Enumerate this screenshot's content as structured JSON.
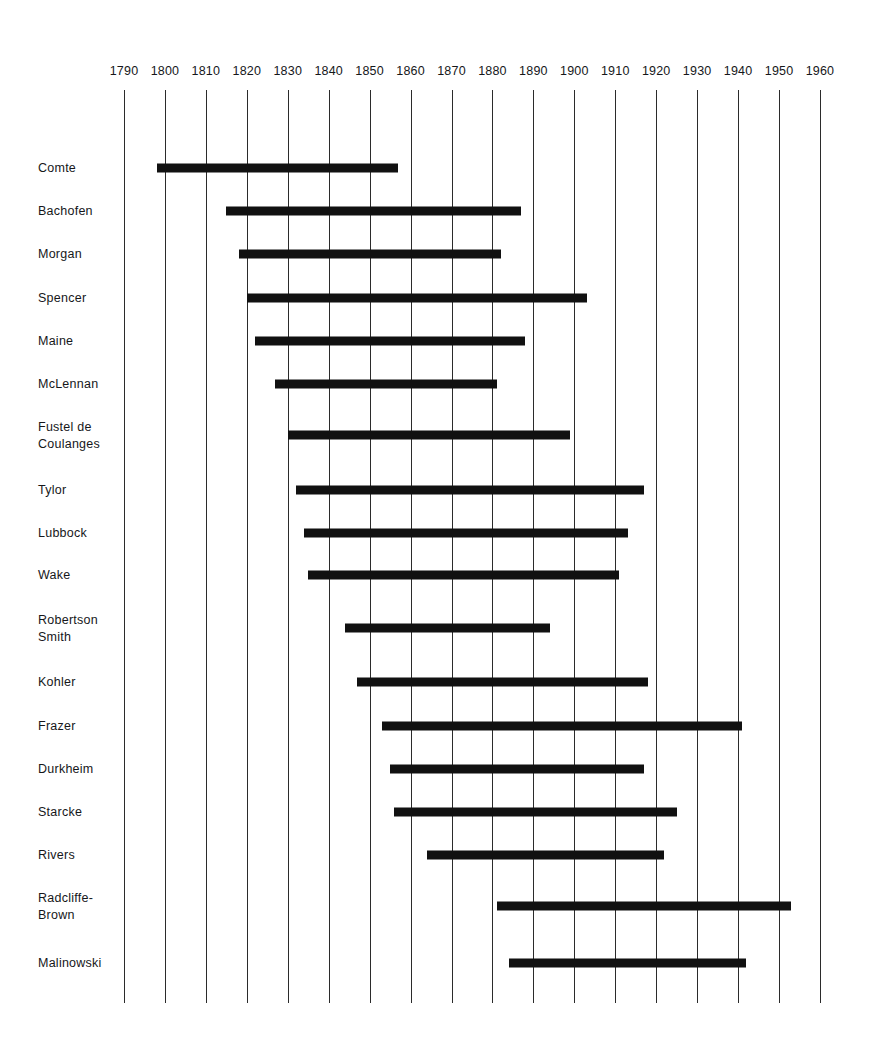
{
  "chart_data": {
    "type": "bar",
    "orientation": "horizontal-timeline",
    "title": "",
    "subtitle": "",
    "xlabel": "",
    "ylabel": "",
    "xlim": [
      1790,
      1960
    ],
    "x_tick_step": 10,
    "grid": true,
    "grid_axis": "x",
    "legend": null,
    "bar_color": "#111111",
    "grid_color": "#2b2b2b",
    "background_color": "#ffffff",
    "x_ticks": [
      "1790",
      "1800",
      "1810",
      "1820",
      "1830",
      "1840",
      "1850",
      "1860",
      "1870",
      "1880",
      "1890",
      "1900",
      "1910",
      "1920",
      "1930",
      "1940",
      "1950",
      "1960"
    ],
    "categories": [
      "Comte",
      "Bachofen",
      "Morgan",
      "Spencer",
      "Maine",
      "McLennan",
      "Fustel de Coulanges",
      "Tylor",
      "Lubbock",
      "Wake",
      "Robertson Smith",
      "Kohler",
      "Frazer",
      "Durkheim",
      "Starcke",
      "Rivers",
      "Radcliffe-Brown",
      "Malinowski"
    ],
    "spans": [
      {
        "name": "Comte",
        "label": "Comte",
        "start": 1798,
        "end": 1857
      },
      {
        "name": "Bachofen",
        "label": "Bachofen",
        "start": 1815,
        "end": 1887
      },
      {
        "name": "Morgan",
        "label": "Morgan",
        "start": 1818,
        "end": 1882
      },
      {
        "name": "Spencer",
        "label": "Spencer",
        "start": 1820,
        "end": 1903
      },
      {
        "name": "Maine",
        "label": "Maine",
        "start": 1822,
        "end": 1888
      },
      {
        "name": "McLennan",
        "label": "McLennan",
        "start": 1827,
        "end": 1881
      },
      {
        "name": "Fustel de Coulanges",
        "label": "Fustel de\nCoulanges",
        "start": 1830,
        "end": 1899
      },
      {
        "name": "Tylor",
        "label": "Tylor",
        "start": 1832,
        "end": 1917
      },
      {
        "name": "Lubbock",
        "label": "Lubbock",
        "start": 1834,
        "end": 1913
      },
      {
        "name": "Wake",
        "label": "Wake",
        "start": 1835,
        "end": 1911
      },
      {
        "name": "Robertson Smith",
        "label": "Robertson\nSmith",
        "start": 1844,
        "end": 1894
      },
      {
        "name": "Kohler",
        "label": "Kohler",
        "start": 1847,
        "end": 1918
      },
      {
        "name": "Frazer",
        "label": "Frazer",
        "start": 1853,
        "end": 1941
      },
      {
        "name": "Durkheim",
        "label": "Durkheim",
        "start": 1855,
        "end": 1917
      },
      {
        "name": "Starcke",
        "label": "Starcke",
        "start": 1856,
        "end": 1925
      },
      {
        "name": "Rivers",
        "label": "Rivers",
        "start": 1864,
        "end": 1922
      },
      {
        "name": "Radcliffe-Brown",
        "label": "Radcliffe-\nBrown",
        "start": 1881,
        "end": 1953
      },
      {
        "name": "Malinowski",
        "label": "Malinowski",
        "start": 1884,
        "end": 1942
      }
    ]
  },
  "layout": {
    "x_origin_px": 124,
    "px_per_decade": 40.94,
    "grid_top_px": 90,
    "grid_bottom_px": 1003,
    "row_centers_px": [
      168,
      211,
      254,
      298,
      341,
      384,
      435,
      490,
      533,
      575,
      628,
      682,
      726,
      769,
      812,
      855,
      906,
      963
    ]
  }
}
